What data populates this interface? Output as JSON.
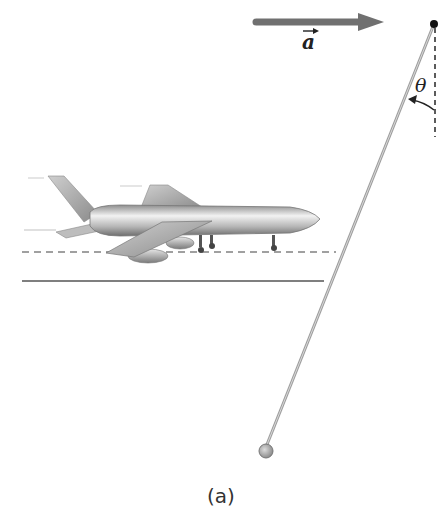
{
  "figure": {
    "caption": "(a)",
    "acceleration_label": "a",
    "angle_label": "θ",
    "colors": {
      "arrow": "#6f6f6f",
      "string": "#a9a9a9",
      "pivot": "#111111",
      "bob": "#a8a8a8",
      "dashed_line": "#9a9a9a",
      "ground_line": "#555555",
      "aircraft": "#b9b9b9"
    }
  },
  "icons": {
    "acceleration_arrow": "right-arrow",
    "pivot": "black-dot",
    "bob": "gray-sphere",
    "aircraft": "jet-airplane"
  }
}
